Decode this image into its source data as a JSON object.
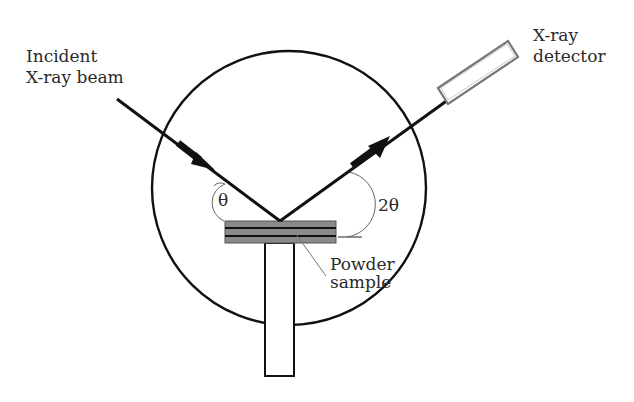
{
  "diagram": {
    "type": "x-ray-diffraction-schematic",
    "labels": {
      "incident": {
        "line1": "Incident",
        "line2": "X-ray beam"
      },
      "detector": {
        "line1": "X-ray",
        "line2": "detector"
      },
      "sample": {
        "line1": "Powder",
        "line2": "sample"
      },
      "theta": "θ",
      "two_theta": "2θ"
    },
    "colors": {
      "stroke": "#111111",
      "sample_fill": "#8a8a8a",
      "detector_stroke": "#777777",
      "arc_stroke": "#666666",
      "text": "#2a2a2a"
    }
  }
}
